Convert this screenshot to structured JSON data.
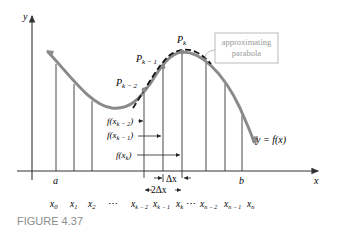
{
  "figure": {
    "caption": "FIGURE 4.37",
    "axes": {
      "x_label": "x",
      "y_label": "y"
    },
    "curve_label": "y = f(x)",
    "points": [
      {
        "name": "P",
        "sub": "k − 2"
      },
      {
        "name": "P",
        "sub": "k − 1"
      },
      {
        "name": "P",
        "sub": "k"
      }
    ],
    "callout": {
      "line1": "approximating",
      "line2": "parabola"
    },
    "value_labels": [
      {
        "pre": "f(x",
        "sub": "k − 2",
        "post": ")"
      },
      {
        "pre": "f(x",
        "sub": "k − 1",
        "post": ")"
      },
      {
        "pre": "f(x",
        "sub": "k",
        "post": ")"
      }
    ],
    "interval_labels": {
      "a": "a",
      "b": "b"
    },
    "delta_labels": {
      "dx": "Δx",
      "two_dx": "2Δx"
    },
    "ticks": [
      {
        "base": "x",
        "sub": "0"
      },
      {
        "base": "x",
        "sub": "1"
      },
      {
        "base": "x",
        "sub": "2"
      },
      {
        "base": "⋯",
        "sub": ""
      },
      {
        "base": "x",
        "sub": "k − 2"
      },
      {
        "base": "x",
        "sub": "k − 1"
      },
      {
        "base": "x",
        "sub": "k"
      },
      {
        "base": "⋯",
        "sub": ""
      },
      {
        "base": "x",
        "sub": "n − 2"
      },
      {
        "base": "x",
        "sub": "n − 1"
      },
      {
        "base": "x",
        "sub": "n"
      }
    ],
    "colors": {
      "curve": "#8a8a8a",
      "axis": "#333333",
      "callout": "#999999",
      "caption": "#8c8c8c",
      "parabola": "#111111"
    }
  }
}
